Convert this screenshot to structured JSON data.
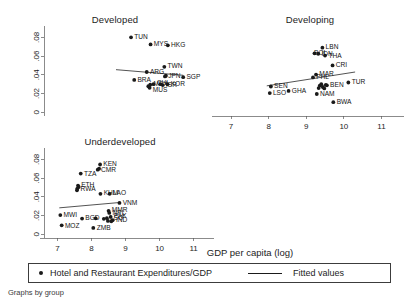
{
  "figure": {
    "xlabel": "GDP per capita (log)",
    "footnote": "Graphs by group",
    "legend": {
      "marker_label": "Hotel and Restaurant Expenditures/GDP",
      "line_label": "Fitted values"
    }
  },
  "chart_data": {
    "type": "scatter",
    "title": "",
    "xlabel": "GDP per capita (log)",
    "ylabel": "",
    "xlim": [
      6.6,
      11.6
    ],
    "ylim": [
      -0.004,
      0.09
    ],
    "xticks": [
      7,
      8,
      9,
      10,
      11
    ],
    "xticklabels": [
      "7",
      "8",
      "9",
      "10",
      "11"
    ],
    "yticks": [
      0,
      0.02,
      0.04,
      0.06,
      0.08
    ],
    "yticklabels": [
      "0",
      ".02",
      ".04",
      ".06",
      ".08"
    ],
    "grid": false,
    "legend_position": "bottom",
    "series_names": [
      "Hotel and Restaurant Expenditures/GDP",
      "Fitted values"
    ],
    "panels": [
      {
        "name": "Developed",
        "title": "Developed",
        "show_xaxis_labels": false,
        "show_yaxis_labels": true,
        "fit": {
          "x0": 8.85,
          "y0": 0.0455,
          "x1": 10.95,
          "y1": 0.0395
        },
        "points": [
          {
            "label": "TUN",
            "x": 9.32,
            "y": 0.08,
            "dx": 3.2,
            "dy": 1.6
          },
          {
            "label": "MYS",
            "x": 9.93,
            "y": 0.0725,
            "dx": 3.2,
            "dy": 1.6
          },
          {
            "label": "HKG",
            "x": 10.47,
            "y": 0.0715,
            "dx": 3.2,
            "dy": 1.6
          },
          {
            "label": "TWN",
            "x": 10.36,
            "y": 0.0485,
            "dx": 3.2,
            "dy": 1.6
          },
          {
            "label": "ARG",
            "x": 9.81,
            "y": 0.043,
            "dx": 3.2,
            "dy": 1.6
          },
          {
            "label": "JPN",
            "x": 10.38,
            "y": 0.0383,
            "dx": 3.2,
            "dy": 1.6
          },
          {
            "label": "SGP",
            "x": 10.95,
            "y": 0.0375,
            "dx": 3.2,
            "dy": 1.6
          },
          {
            "label": "BRA",
            "x": 9.42,
            "y": 0.0345,
            "dx": 3.2,
            "dy": 1.6
          },
          {
            "label": "MEX",
            "x": 9.92,
            "y": 0.0295,
            "dx": 3.2,
            "dy": 1.2
          },
          {
            "label": "CHL",
            "x": 10.02,
            "y": 0.03,
            "dx": 3.2,
            "dy": 1.2
          },
          {
            "label": "ISR",
            "x": 10.31,
            "y": 0.029,
            "dx": 3.2,
            "dy": 1.4
          },
          {
            "label": "KOR",
            "x": 10.46,
            "y": 0.03,
            "dx": 3.2,
            "dy": 1.4
          },
          {
            "label": "MUS",
            "x": 9.9,
            "y": 0.0262,
            "dx": 3.2,
            "dy": 4.2
          },
          {
            "label": "",
            "x": 9.86,
            "y": 0.0278,
            "dx": 0,
            "dy": 0
          },
          {
            "label": "",
            "x": 10.24,
            "y": 0.03,
            "dx": 0,
            "dy": 0
          },
          {
            "label": "",
            "x": 10.41,
            "y": 0.039,
            "dx": 0,
            "dy": 0
          }
        ]
      },
      {
        "name": "Developing",
        "title": "Developing",
        "show_xaxis_labels": true,
        "show_yaxis_labels": false,
        "fit": {
          "x0": 7.95,
          "y0": 0.0282,
          "x1": 10.3,
          "y1": 0.043
        },
        "points": [
          {
            "label": "LBN",
            "x": 9.43,
            "y": 0.069,
            "dx": 3.2,
            "dy": 1.4
          },
          {
            "label": "IDN",
            "x": 9.32,
            "y": 0.0625,
            "dx": 3.2,
            "dy": 1.8
          },
          {
            "label": "THA",
            "x": 9.5,
            "y": 0.0605,
            "dx": 3.4,
            "dy": 2.2
          },
          {
            "label": "BOL",
            "x": 9.22,
            "y": 0.063,
            "dx": -0.5,
            "dy": 1.4
          },
          {
            "label": "CRI",
            "x": 9.7,
            "y": 0.05,
            "dx": 3.2,
            "dy": 1.6
          },
          {
            "label": "MAR",
            "x": 9.26,
            "y": 0.0402,
            "dx": 3.2,
            "dy": 1.2
          },
          {
            "label": "PHL",
            "x": 9.18,
            "y": 0.0372,
            "dx": 3.2,
            "dy": 1.8
          },
          {
            "label": "TUR",
            "x": 10.12,
            "y": 0.0318,
            "dx": 3.4,
            "dy": 1.6
          },
          {
            "label": "BEN",
            "x": 9.55,
            "y": 0.0288,
            "dx": 3.2,
            "dy": 1.4
          },
          {
            "label": "SEN",
            "x": 8.06,
            "y": 0.0275,
            "dx": 3.2,
            "dy": 1.4
          },
          {
            "label": "GHA",
            "x": 8.53,
            "y": 0.0228,
            "dx": 3.2,
            "dy": 1.6
          },
          {
            "label": "LSO",
            "x": 8.03,
            "y": 0.0205,
            "dx": 3.2,
            "dy": 1.8
          },
          {
            "label": "NAM",
            "x": 9.28,
            "y": 0.0195,
            "dx": 3.2,
            "dy": 1.8
          },
          {
            "label": "BWA",
            "x": 9.72,
            "y": 0.0108,
            "dx": 3.4,
            "dy": 1.8
          },
          {
            "label": "",
            "x": 9.36,
            "y": 0.0285,
            "dx": 0,
            "dy": 0
          },
          {
            "label": "",
            "x": 9.44,
            "y": 0.027,
            "dx": 0,
            "dy": 0
          },
          {
            "label": "",
            "x": 9.48,
            "y": 0.0255,
            "dx": 0,
            "dy": 0
          },
          {
            "label": "",
            "x": 9.4,
            "y": 0.03,
            "dx": 0,
            "dy": 0
          },
          {
            "label": "",
            "x": 9.52,
            "y": 0.0292,
            "dx": 0,
            "dy": 0
          },
          {
            "label": "",
            "x": 9.33,
            "y": 0.0258,
            "dx": 0,
            "dy": 0
          }
        ]
      },
      {
        "name": "Underdeveloped",
        "title": "Underdeveloped",
        "show_xaxis_labels": true,
        "show_yaxis_labels": true,
        "fit": {
          "x0": 7.05,
          "y0": 0.0282,
          "x1": 8.85,
          "y1": 0.034
        },
        "points": [
          {
            "label": "KEN",
            "x": 8.25,
            "y": 0.0745,
            "dx": 3.2,
            "dy": 1.4
          },
          {
            "label": "CMR",
            "x": 8.18,
            "y": 0.069,
            "dx": 3.2,
            "dy": 2.6
          },
          {
            "label": "TZA",
            "x": 7.68,
            "y": 0.0648,
            "dx": 3.2,
            "dy": 2.0
          },
          {
            "label": "ETH",
            "x": 7.6,
            "y": 0.052,
            "dx": 3.2,
            "dy": 1.4
          },
          {
            "label": "RWA",
            "x": 7.58,
            "y": 0.0488,
            "dx": 3.2,
            "dy": 2.0
          },
          {
            "label": "KHM",
            "x": 8.26,
            "y": 0.0432,
            "dx": 3.2,
            "dy": 1.6
          },
          {
            "label": "LAO",
            "x": 8.53,
            "y": 0.0432,
            "dx": 3.2,
            "dy": 1.6
          },
          {
            "label": "VNM",
            "x": 8.82,
            "y": 0.0335,
            "dx": 3.2,
            "dy": 2.2
          },
          {
            "label": "MMR",
            "x": 8.5,
            "y": 0.025,
            "dx": 3.2,
            "dy": 1.4
          },
          {
            "label": "NPL",
            "x": 8.52,
            "y": 0.0228,
            "dx": 3.2,
            "dy": 1.6
          },
          {
            "label": "MWI",
            "x": 7.08,
            "y": 0.0205,
            "dx": 3.2,
            "dy": 1.8
          },
          {
            "label": "BGD",
            "x": 7.72,
            "y": 0.0168,
            "dx": 3.2,
            "dy": 1.6
          },
          {
            "label": "LSO",
            "x": 8.45,
            "y": 0.0172,
            "dx": 3.2,
            "dy": 2.0
          },
          {
            "label": "PAK",
            "x": 8.56,
            "y": 0.0185,
            "dx": 3.2,
            "dy": 1.2
          },
          {
            "label": "IND",
            "x": 8.62,
            "y": 0.015,
            "dx": 3.2,
            "dy": 1.8
          },
          {
            "label": "MOZ",
            "x": 7.12,
            "y": 0.0095,
            "dx": 3.2,
            "dy": 2.4
          },
          {
            "label": "ZMB",
            "x": 8.05,
            "y": 0.0068,
            "dx": 3.4,
            "dy": 2.2
          },
          {
            "label": "",
            "x": 8.12,
            "y": 0.017,
            "dx": 0,
            "dy": 0
          },
          {
            "label": "",
            "x": 8.36,
            "y": 0.0165,
            "dx": 0,
            "dy": 0
          },
          {
            "label": "",
            "x": 8.48,
            "y": 0.0142,
            "dx": 0,
            "dy": 0
          },
          {
            "label": "",
            "x": 8.58,
            "y": 0.0138,
            "dx": 0,
            "dy": 0
          },
          {
            "label": "",
            "x": 8.22,
            "y": 0.07,
            "dx": 0,
            "dy": 0
          },
          {
            "label": "",
            "x": 7.62,
            "y": 0.0505,
            "dx": 0,
            "dy": 0
          },
          {
            "label": "",
            "x": 7.57,
            "y": 0.047,
            "dx": 0,
            "dy": 0
          }
        ]
      }
    ]
  }
}
